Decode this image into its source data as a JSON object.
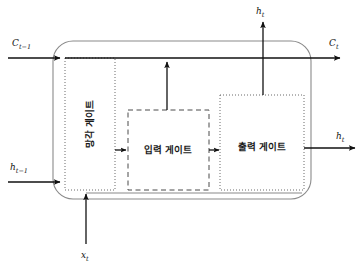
{
  "diagram": {
    "colors": {
      "stroke": "#111111",
      "cell_border": "#7a7a7a",
      "gate_border": "#555555",
      "background": "#ffffff",
      "text": "#1a1a1a"
    },
    "cell": {
      "name": "lstm-cell",
      "shape": "rounded-rectangle"
    },
    "gates": [
      {
        "id": "forget-gate",
        "label": "망각 게이트",
        "border_style": "dotted",
        "x": 65,
        "y": 58,
        "width": 50,
        "height": 132,
        "label_orientation": "vertical",
        "label_x": 90,
        "label_y": 124
      },
      {
        "id": "input-gate",
        "label": "입력 게이트",
        "border_style": "dashed",
        "x": 128,
        "y": 110,
        "width": 81,
        "height": 80,
        "label_orientation": "horizontal",
        "label_x": 168,
        "label_y": 150
      },
      {
        "id": "output-gate",
        "label": "출력 게이트",
        "border_style": "dotted",
        "x": 220,
        "y": 95,
        "width": 84,
        "height": 95,
        "label_orientation": "horizontal",
        "label_x": 262,
        "label_y": 147
      }
    ],
    "io_labels": [
      {
        "id": "cell-state-in",
        "base": "C",
        "sub": "t−1",
        "x": 14,
        "y": 43,
        "role": "input",
        "position": "top-left"
      },
      {
        "id": "cell-state-out",
        "base": "C",
        "sub": "t",
        "x": 330,
        "y": 43,
        "role": "output",
        "position": "top-right"
      },
      {
        "id": "hidden-out-top",
        "base": "h",
        "sub": "t",
        "x": 254,
        "y": 14,
        "role": "output",
        "position": "top-center"
      },
      {
        "id": "hidden-in",
        "base": "h",
        "sub": "t−1",
        "x": 12,
        "y": 166,
        "role": "input",
        "position": "left-middle"
      },
      {
        "id": "hidden-out-right",
        "base": "h",
        "sub": "t",
        "x": 338,
        "y": 143,
        "role": "output",
        "position": "right-middle"
      },
      {
        "id": "input-x",
        "base": "x",
        "sub": "t",
        "x": 84,
        "y": 255,
        "role": "input",
        "position": "bottom-center"
      }
    ],
    "connections": [
      {
        "id": "conn-cell-state-top",
        "desc": "cell state horizontal line left to right"
      },
      {
        "id": "conn-hidden-in",
        "desc": "previous hidden state into cell"
      },
      {
        "id": "conn-input-x",
        "desc": "input x_t upward into cell"
      },
      {
        "id": "conn-forget-to-input",
        "desc": "forget gate to input gate"
      },
      {
        "id": "conn-input-to-output",
        "desc": "input gate to output gate"
      },
      {
        "id": "conn-input-up",
        "desc": "input gate up to cell state line"
      },
      {
        "id": "conn-output-up",
        "desc": "output gate up to h_t output"
      },
      {
        "id": "conn-output-right",
        "desc": "output gate right to h_t output"
      },
      {
        "id": "conn-bottom-rail",
        "desc": "bottom recurrence rail"
      }
    ]
  }
}
